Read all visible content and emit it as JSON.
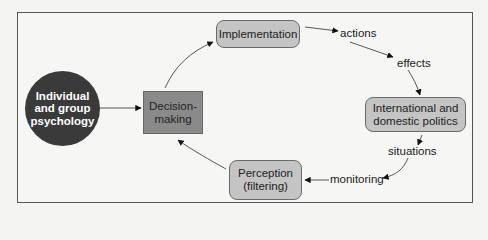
{
  "diagram": {
    "nodes": {
      "psychology": {
        "label": "Individual\nand group\npsychology",
        "line1": "Individual",
        "line2": "and group",
        "line3": "psychology",
        "shape": "circle",
        "fill": "#3a3a3a"
      },
      "decision": {
        "line1": "Decision-",
        "line2": "making",
        "shape": "square",
        "fill": "#8a8a8a"
      },
      "implementation": {
        "label": "Implementation",
        "shape": "rounded-rect",
        "fill": "#c4c4c4"
      },
      "politics": {
        "line1": "International and",
        "line2": "domestic politics",
        "shape": "rounded-rect",
        "fill": "#c4c4c4"
      },
      "perception": {
        "line1": "Perception",
        "line2": "(filtering)",
        "shape": "rounded-rect",
        "fill": "#c4c4c4"
      }
    },
    "edge_labels": {
      "actions": "actions",
      "effects": "effects",
      "situations": "situations",
      "monitoring": "monitoring"
    },
    "edges": [
      {
        "from": "psychology",
        "to": "decision"
      },
      {
        "from": "decision",
        "to": "implementation"
      },
      {
        "from": "implementation",
        "to": "actions"
      },
      {
        "from": "actions",
        "to": "effects"
      },
      {
        "from": "effects",
        "to": "politics"
      },
      {
        "from": "politics",
        "to": "situations"
      },
      {
        "from": "situations",
        "to": "monitoring"
      },
      {
        "from": "monitoring",
        "to": "perception"
      },
      {
        "from": "perception",
        "to": "decision"
      }
    ]
  }
}
